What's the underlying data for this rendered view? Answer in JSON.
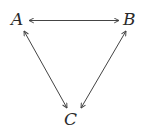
{
  "diagram": {
    "type": "triangle-graph",
    "nodes": [
      {
        "id": "A",
        "label": "A"
      },
      {
        "id": "B",
        "label": "B"
      },
      {
        "id": "C",
        "label": "C"
      }
    ],
    "edges": [
      {
        "from": "A",
        "to": "B",
        "direction": "bidirectional"
      },
      {
        "from": "A",
        "to": "C",
        "direction": "bidirectional"
      },
      {
        "from": "B",
        "to": "C",
        "direction": "bidirectional"
      }
    ],
    "colors": {
      "stroke": "#444444",
      "text": "#2a2a2a",
      "background": "#ffffff"
    }
  }
}
